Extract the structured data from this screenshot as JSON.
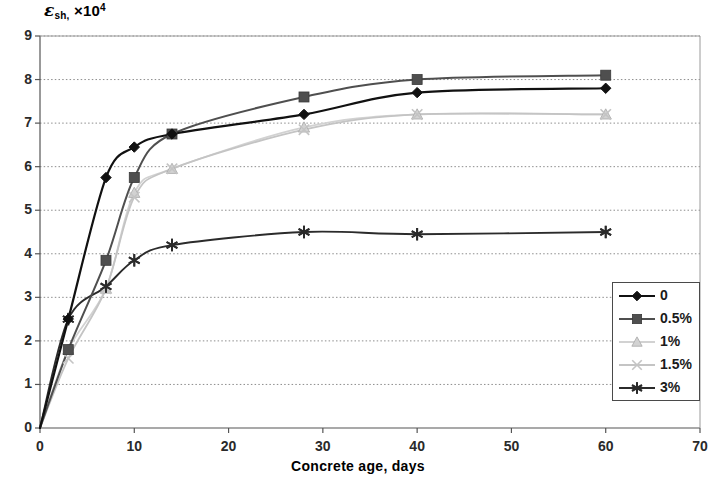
{
  "chart_data": {
    "type": "line",
    "title": "",
    "xlabel": "Concrete age, days",
    "ylabel": "εsh, ×10⁴",
    "ylabel_parts": {
      "symbol": "ε",
      "subscript": "sh,",
      "multiplier": "×10",
      "exponent": "4"
    },
    "xlim": [
      0,
      70
    ],
    "ylim": [
      0,
      9
    ],
    "xticks": [
      0,
      10,
      20,
      30,
      40,
      50,
      60,
      70
    ],
    "yticks": [
      0,
      1,
      2,
      3,
      4,
      5,
      6,
      7,
      8,
      9
    ],
    "grid": "horizontal-dotted",
    "legend_position": "right-inside-lower",
    "series": [
      {
        "name": "0",
        "marker": "diamond",
        "color": "#111111",
        "line_width": 2.2,
        "x": [
          0,
          3,
          7,
          10,
          14,
          28,
          40,
          60
        ],
        "y": [
          0,
          2.5,
          5.75,
          6.45,
          6.75,
          7.2,
          7.7,
          7.8
        ]
      },
      {
        "name": "0.5%",
        "marker": "square",
        "color": "#4f4f4f",
        "line_width": 2.0,
        "x": [
          0,
          3,
          7,
          10,
          14,
          28,
          40,
          60
        ],
        "y": [
          0,
          1.8,
          3.85,
          5.75,
          6.75,
          7.6,
          8.0,
          8.1
        ]
      },
      {
        "name": "1%",
        "marker": "triangle",
        "color": "#d2d2d2",
        "line_width": 1.8,
        "x": [
          0,
          3,
          7,
          10,
          14,
          28,
          40,
          60
        ],
        "y": [
          0,
          1.8,
          3.2,
          5.4,
          5.95,
          6.9,
          7.2,
          7.2
        ]
      },
      {
        "name": "1.5%",
        "marker": "x",
        "color": "#c4c4c4",
        "line_width": 1.8,
        "x": [
          0,
          3,
          7,
          10,
          14,
          28,
          40,
          60
        ],
        "y": [
          0,
          1.6,
          3.2,
          5.3,
          5.95,
          6.85,
          7.2,
          7.2
        ]
      },
      {
        "name": "3%",
        "marker": "asterisk",
        "color": "#2b2b2b",
        "line_width": 1.9,
        "x": [
          0,
          3,
          7,
          10,
          14,
          28,
          40,
          60
        ],
        "y": [
          0,
          2.5,
          3.25,
          3.85,
          4.2,
          4.5,
          4.45,
          4.5
        ]
      }
    ]
  },
  "legend": {
    "items": [
      {
        "label": "0",
        "marker": "diamond",
        "color": "#111111"
      },
      {
        "label": "0.5%",
        "marker": "square",
        "color": "#4f4f4f"
      },
      {
        "label": "1%",
        "marker": "triangle",
        "color": "#d2d2d2"
      },
      {
        "label": "1.5%",
        "marker": "x",
        "color": "#c4c4c4"
      },
      {
        "label": "3%",
        "marker": "asterisk",
        "color": "#2b2b2b"
      }
    ]
  },
  "axes": {
    "x_tick_labels": [
      "0",
      "10",
      "20",
      "30",
      "40",
      "50",
      "60",
      "70"
    ],
    "y_tick_labels": [
      "0",
      "1",
      "2",
      "3",
      "4",
      "5",
      "6",
      "7",
      "8",
      "9"
    ]
  }
}
